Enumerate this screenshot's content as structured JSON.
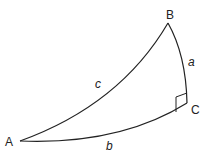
{
  "diagram": {
    "type": "spherical-right-triangle",
    "vertices": {
      "A": {
        "label": "A"
      },
      "B": {
        "label": "B"
      },
      "C": {
        "label": "C"
      }
    },
    "sides": {
      "a": {
        "label": "a",
        "between": [
          "B",
          "C"
        ]
      },
      "b": {
        "label": "b",
        "between": [
          "A",
          "C"
        ]
      },
      "c": {
        "label": "c",
        "between": [
          "A",
          "B"
        ]
      }
    },
    "right_angle_at": "C",
    "stroke_color": "#222222"
  }
}
